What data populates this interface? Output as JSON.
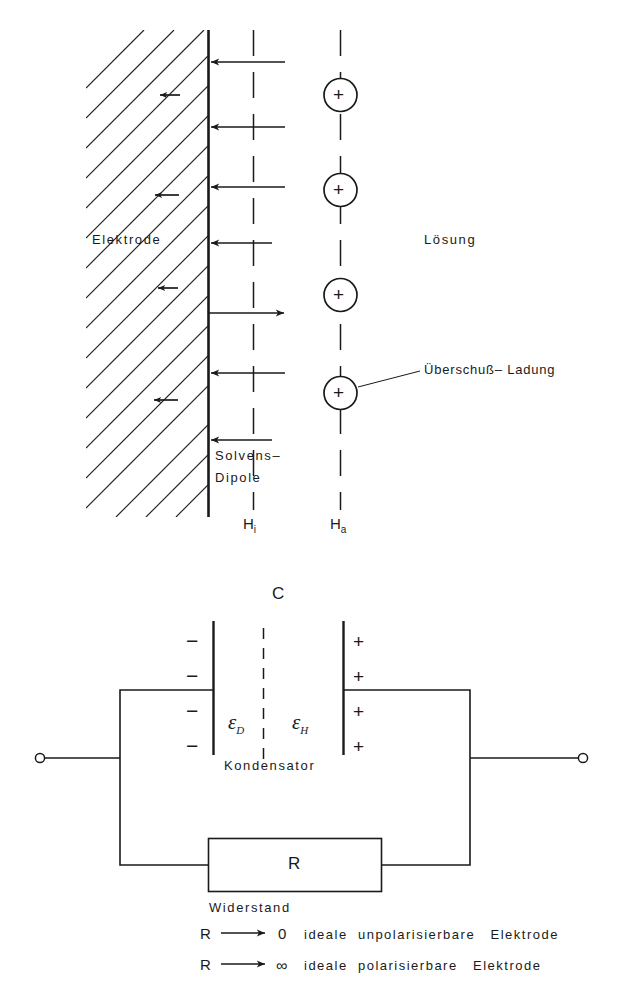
{
  "figure": {
    "title_top": "Elektrode / Lösung Doppelschicht",
    "title_bottom": "Ersatzschaltbild"
  },
  "top_diagram": {
    "electrode_label": "Elektrode",
    "solution_label": "Lösung",
    "excess_charge_label": "Überschuß– Ladung",
    "solvent_label_line1": "Solvens–",
    "solvent_label_line2": "Dipole",
    "plane_inner_base": "H",
    "plane_inner_sub": "i",
    "plane_outer_base": "H",
    "plane_outer_sub": "a",
    "ion_symbol": "+",
    "ion_count": 4,
    "dipole_arrow_count_left": 7,
    "dipole_arrow_count_right": 1
  },
  "circuit": {
    "capacitor_label": "C",
    "capacitor_name": "Kondensator",
    "resistor_label": "R",
    "resistor_name": "Widerstand",
    "eps_d_base": "ε",
    "eps_d_sub": "D",
    "eps_h_base": "ε",
    "eps_h_sub": "H",
    "negative_sign": "−",
    "positive_sign": "+",
    "negative_count": 4,
    "positive_count": 4
  },
  "conditions": [
    {
      "symbol": "R",
      "arrow": "⟶",
      "limit": "0",
      "description": "ideale  unpolarisierbare   Elektrode"
    },
    {
      "symbol": "R",
      "arrow": "⟶",
      "limit": "∞",
      "description": "ideale  polarisierbare   Elektrode"
    }
  ],
  "colors": {
    "ink": "#1a1a1a",
    "hatch": "#222222",
    "background": "#ffffff"
  }
}
